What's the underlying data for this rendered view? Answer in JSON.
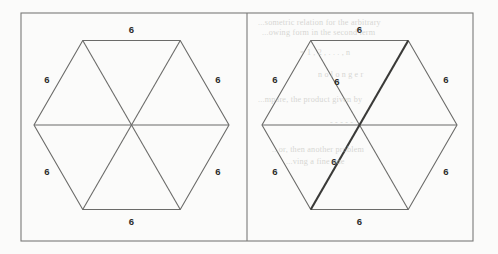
{
  "figure": {
    "background_color": "#fbfbfa",
    "frame": {
      "name": "outer-frame",
      "x": 21,
      "y": 13,
      "width": 452,
      "height": 228,
      "stroke": "#7a7a78",
      "stroke_width": 1.1,
      "divider_x": 247
    },
    "hexagons": [
      {
        "id": "left",
        "name": "hexagon-left",
        "caption": "plain triangulated hexagon",
        "center_x": 131.5,
        "center_y": 125,
        "radius": 97.5,
        "orientation": "pointy-left-right",
        "stroke": "#6b6b69",
        "stroke_width": 1.1,
        "fill": "none",
        "diagonals_count": 3,
        "triangles_count": 6,
        "highlight": null,
        "side_labels": [
          {
            "text": "6",
            "name": "side-label-top",
            "x": 131.5,
            "y": 30
          },
          {
            "text": "6",
            "name": "side-label-upper-right",
            "x": 218,
            "y": 80
          },
          {
            "text": "6",
            "name": "side-label-lower-right",
            "x": 218,
            "y": 172
          },
          {
            "text": "6",
            "name": "side-label-bottom",
            "x": 131.5,
            "y": 222
          },
          {
            "text": "6",
            "name": "side-label-lower-left",
            "x": 47,
            "y": 172
          },
          {
            "text": "6",
            "name": "side-label-upper-left",
            "x": 47,
            "y": 80
          }
        ],
        "diagonal_labels": []
      },
      {
        "id": "right",
        "name": "hexagon-right",
        "caption": "triangulated hexagon with one diagonal emphasised",
        "center_x": 359.5,
        "center_y": 125,
        "radius": 97.5,
        "orientation": "pointy-left-right",
        "stroke": "#6b6b69",
        "stroke_width": 1.1,
        "fill": "none",
        "diagonals_count": 3,
        "triangles_count": 6,
        "highlight": {
          "name": "highlighted-diagonal",
          "from_vertex": "upper-right",
          "to_vertex": "lower-left",
          "stroke": "#3a3a38",
          "stroke_width": 2.1
        },
        "side_labels": [
          {
            "text": "6",
            "name": "side-label-top",
            "x": 359.5,
            "y": 30
          },
          {
            "text": "6",
            "name": "side-label-upper-right",
            "x": 446,
            "y": 80
          },
          {
            "text": "6",
            "name": "side-label-lower-right",
            "x": 446,
            "y": 172
          },
          {
            "text": "6",
            "name": "side-label-bottom",
            "x": 359.5,
            "y": 222
          },
          {
            "text": "6",
            "name": "side-label-lower-left",
            "x": 275,
            "y": 172
          },
          {
            "text": "6",
            "name": "side-label-upper-left",
            "x": 275,
            "y": 80
          }
        ],
        "diagonal_labels": [
          {
            "text": "6",
            "name": "diagonal-label-upper",
            "x": 337,
            "y": 82
          },
          {
            "text": "6",
            "name": "diagonal-label-lower",
            "x": 334,
            "y": 162
          }
        ]
      }
    ],
    "label_style": {
      "color": "#2b2b2a",
      "font_size": 9.5,
      "font_weight": "bold"
    },
    "bleed_through_text": [
      {
        "text": "...sometric  relation  for  the  arbitrary",
        "x": 258,
        "y": 18,
        "size": 8.2
      },
      {
        "text": "...owing  form  in  the  second  term",
        "x": 262,
        "y": 28,
        "size": 8.2
      },
      {
        "text": "= 1 , 2 , . . . , n",
        "x": 300,
        "y": 48,
        "size": 8.0
      },
      {
        "text": "n o  l o n g e r",
        "x": 318,
        "y": 70,
        "size": 8.0
      },
      {
        "text": "...mpare,  the  product  given  by",
        "x": 258,
        "y": 95,
        "size": 8.2
      },
      {
        "text": "...or,  then  another  problem",
        "x": 272,
        "y": 145,
        "size": 8.2
      },
      {
        "text": "...ving  a  fine  one",
        "x": 286,
        "y": 157,
        "size": 8.2
      },
      {
        "text": "-  -  -  -  -",
        "x": 330,
        "y": 118,
        "size": 8.0
      }
    ]
  }
}
